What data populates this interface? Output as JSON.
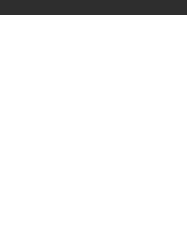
{
  "fret_label": "7 fr",
  "colors": {
    "topbar": "#2e2e2e",
    "dot": "#333333",
    "line": "#6a6a6a"
  },
  "grid": {
    "strings": 6,
    "frets": 5,
    "string_x": [
      18,
      47,
      76,
      105,
      133,
      162
    ],
    "fret_line_y": [
      40,
      82,
      121,
      159,
      197,
      233
    ],
    "fret_center_y": [
      61,
      101,
      140,
      178,
      215
    ]
  },
  "markers": [
    {
      "fret": 1,
      "string": 1,
      "type": "dot"
    },
    {
      "fret": 1,
      "string": 4,
      "type": "dot"
    },
    {
      "fret": 1,
      "string": 6,
      "type": "dot"
    },
    {
      "fret": 2,
      "string": 1,
      "type": "dot"
    },
    {
      "fret": 2,
      "string": 2,
      "type": "dot"
    },
    {
      "fret": 2,
      "string": 3,
      "type": "dot"
    },
    {
      "fret": 2,
      "string": 4,
      "type": "dot"
    },
    {
      "fret": 2,
      "string": 6,
      "type": "dot"
    },
    {
      "fret": 3,
      "string": 1,
      "type": "dot"
    },
    {
      "fret": 3,
      "string": 2,
      "type": "dot"
    },
    {
      "fret": 3,
      "string": 3,
      "type": "dot"
    },
    {
      "fret": 3,
      "string": 5,
      "type": "square"
    },
    {
      "fret": 3,
      "string": 6,
      "type": "dot"
    },
    {
      "fret": 4,
      "string": 1,
      "type": "dot"
    },
    {
      "fret": 4,
      "string": 3,
      "type": "dot"
    },
    {
      "fret": 4,
      "string": 4,
      "type": "dot"
    },
    {
      "fret": 4,
      "string": 6,
      "type": "dot"
    },
    {
      "fret": 5,
      "string": 1,
      "type": "dot"
    },
    {
      "fret": 5,
      "string": 2,
      "type": "square"
    },
    {
      "fret": 5,
      "string": 3,
      "type": "dot"
    },
    {
      "fret": 5,
      "string": 4,
      "type": "dot"
    },
    {
      "fret": 5,
      "string": 5,
      "type": "dot"
    },
    {
      "fret": 5,
      "string": 6,
      "type": "dot"
    }
  ]
}
